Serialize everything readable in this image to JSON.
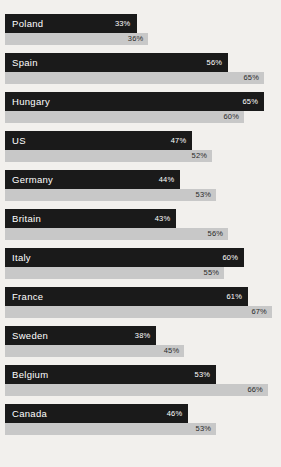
{
  "chart_data": {
    "type": "bar",
    "title": "",
    "subtitle": "",
    "xlabel": "",
    "ylabel": "",
    "orientation": "horizontal",
    "grid": false,
    "legend_position": "none",
    "xlim": [
      0,
      67
    ],
    "value_suffix": "%",
    "categories": [
      "Poland",
      "Spain",
      "Hungary",
      "US",
      "Germany",
      "Britain",
      "Italy",
      "France",
      "Sweden",
      "Belgium",
      "Canada"
    ],
    "series": [
      {
        "name": "primary",
        "color": "#1a1a1a",
        "values": [
          33,
          56,
          65,
          47,
          44,
          43,
          60,
          61,
          38,
          53,
          46
        ],
        "labels": [
          "33%",
          "56%",
          "65%",
          "47%",
          "44%",
          "43%",
          "60%",
          "61%",
          "38%",
          "53%",
          "46%"
        ]
      },
      {
        "name": "secondary",
        "color": "#c8c8c8",
        "values": [
          36,
          65,
          60,
          52,
          53,
          56,
          55,
          67,
          45,
          66,
          53
        ],
        "labels": [
          "36%",
          "65%",
          "60%",
          "52%",
          "53%",
          "56%",
          "55%",
          "67%",
          "45%",
          "66%",
          "53%"
        ]
      }
    ]
  },
  "colors": {
    "background": "#f2f0ed",
    "primary_bar": "#1a1a1a",
    "secondary_bar": "#c8c8c8",
    "primary_text": "#ffffff",
    "secondary_text": "#2b2b2b"
  }
}
